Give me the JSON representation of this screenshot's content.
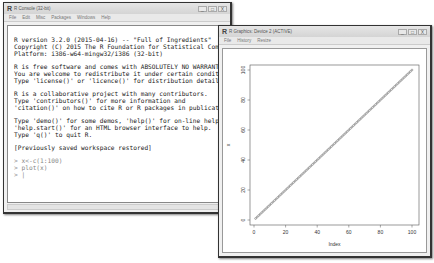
{
  "console": {
    "title": "R Console (32-bit)",
    "menu": [
      "File",
      "Edit",
      "Misc",
      "Packages",
      "Windows",
      "Help"
    ],
    "lines": [
      "R version 3.2.0 (2015-04-16) -- \"Full of Ingredients\"",
      "Copyright (C) 2015 The R Foundation for Statistical Computing",
      "Platform: i386-w64-mingw32/i386 (32-bit)",
      "",
      "R is free software and comes with ABSOLUTELY NO WARRANTY.",
      "You are welcome to redistribute it under certain conditions.",
      "Type 'license()' or 'licence()' for distribution details.",
      "",
      "R is a collaborative project with many contributors.",
      "Type 'contributors()' for more information and",
      "'citation()' on how to cite R or R packages in publications.",
      "",
      "Type 'demo()' for some demos, 'help()' for on-line help, or",
      "'help.start()' for an HTML browser interface to help.",
      "Type 'q()' to quit R.",
      "",
      "[Previously saved workspace restored]",
      ""
    ],
    "inputs": [
      "> x<-c(1:100)",
      "> plot(x)",
      "> |"
    ],
    "window_buttons": [
      "_",
      "□",
      "X"
    ]
  },
  "graphics": {
    "title": "R Graphics: Device 2 (ACTIVE)",
    "menu": [
      "File",
      "History",
      "Resize"
    ],
    "window_buttons": [
      "_",
      "□",
      "X"
    ]
  },
  "chart_data": {
    "type": "scatter",
    "title": "",
    "xlabel": "Index",
    "ylabel": "x",
    "x": "1..100",
    "y": "1..100 (y = x)",
    "xlim": [
      0,
      100
    ],
    "ylim": [
      0,
      100
    ],
    "xticks": [
      "0",
      "20",
      "40",
      "60",
      "80",
      "100"
    ],
    "yticks": [
      "0",
      "20",
      "40",
      "60",
      "80",
      "100"
    ],
    "grid": false,
    "n_points": 100
  }
}
